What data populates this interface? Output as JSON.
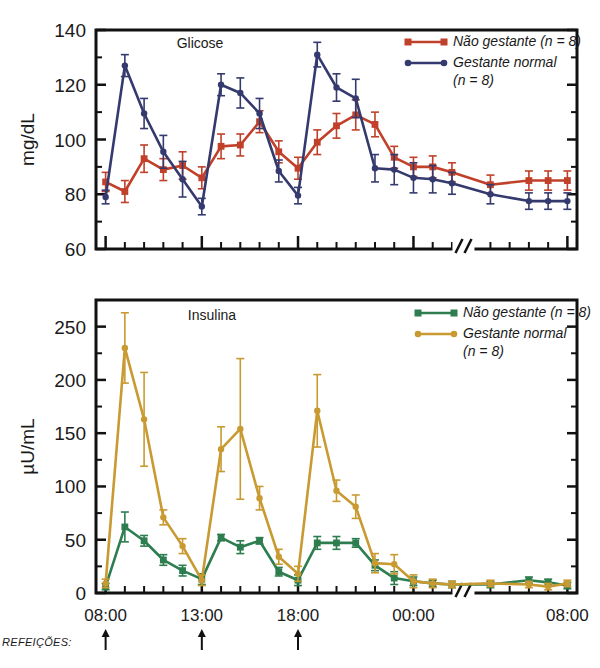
{
  "figure": {
    "background": "#ffffff",
    "meals_label": "REFEIÇÕES:",
    "axis_break_symbol": "//"
  },
  "chart_data": [
    {
      "type": "line",
      "title": "Glicose",
      "xlabel": "",
      "ylabel": "mg/dL",
      "ylim": [
        60,
        140
      ],
      "yticks": [
        60,
        80,
        100,
        120,
        140
      ],
      "yminor_step": 10,
      "grid": false,
      "legend_position": "top-right",
      "xlim_hours": [
        7.5,
        32.5
      ],
      "xtick_labels": [
        "08:00",
        "13:00",
        "18:00",
        "00:00",
        "08:00"
      ],
      "xtick_hours": [
        8,
        13,
        18,
        24,
        32
      ],
      "axis_break_hour": 26.6,
      "meal_arrow_hours": [
        8,
        13,
        18
      ],
      "series": [
        {
          "name": "Não gestante (n = 8)",
          "color": "#c0402a",
          "marker": "square",
          "x": [
            8,
            9,
            10,
            11,
            12,
            13,
            14,
            15,
            16,
            17,
            18,
            19,
            20,
            21,
            22,
            23,
            24,
            25,
            26,
            28,
            30,
            31,
            32
          ],
          "values": [
            84.5,
            81,
            93,
            89,
            90.5,
            86,
            97.5,
            98,
            106.5,
            95.5,
            89.5,
            99,
            105,
            109,
            105.5,
            93.5,
            90,
            90,
            88,
            83.5,
            85,
            85,
            85
          ],
          "err": [
            3.5,
            4,
            5,
            4,
            5,
            4,
            4.5,
            4,
            4,
            4,
            4,
            4.5,
            4.5,
            5.5,
            4.5,
            4,
            3.5,
            4,
            3.5,
            3.5,
            3.5,
            3.5,
            3.5
          ]
        },
        {
          "name": "Gestante normal (n = 8)",
          "color": "#353a6e",
          "marker": "circle",
          "x": [
            8,
            9,
            10,
            11,
            12,
            13,
            14,
            15,
            16,
            17,
            18,
            19,
            20,
            21,
            22,
            23,
            24,
            25,
            26,
            28,
            30,
            31,
            32
          ],
          "values": [
            79,
            127,
            109.5,
            95.5,
            85.5,
            75.5,
            120,
            117,
            109.5,
            88.5,
            79.5,
            131,
            119,
            115,
            89.5,
            89,
            86,
            85.5,
            84,
            80,
            77.5,
            77.5,
            77.5
          ],
          "err": [
            2.5,
            4,
            5.5,
            6,
            6.5,
            3,
            4,
            5.5,
            5.5,
            4,
            3,
            4.5,
            5,
            7,
            5,
            5.5,
            5.5,
            5,
            4,
            3.5,
            3,
            3,
            3
          ]
        }
      ]
    },
    {
      "type": "line",
      "title": "Insulina",
      "xlabel": "",
      "ylabel": "µU/mL",
      "ylim": [
        0,
        275
      ],
      "yticks": [
        0,
        50,
        100,
        150,
        200,
        250
      ],
      "yminor_step": 25,
      "grid": false,
      "legend_position": "top-right",
      "xlim_hours": [
        7.5,
        32.5
      ],
      "xtick_labels": [
        "08:00",
        "13:00",
        "18:00",
        "00:00",
        "08:00"
      ],
      "xtick_hours": [
        8,
        13,
        18,
        24,
        32
      ],
      "axis_break_hour": 26.6,
      "meal_arrow_hours": [
        8,
        13,
        18
      ],
      "series": [
        {
          "name": "Não gestante (n = 8)",
          "color": "#2e7d4f",
          "marker": "square",
          "x": [
            8,
            9,
            10,
            11,
            12,
            13,
            14,
            15,
            16,
            17,
            18,
            19,
            20,
            21,
            22,
            23,
            24,
            25,
            26,
            28,
            30,
            31,
            32
          ],
          "values": [
            6,
            62,
            49,
            31,
            21,
            13,
            52,
            43,
            49,
            20,
            12,
            47,
            47,
            47,
            26,
            14,
            11,
            9,
            8,
            8,
            12,
            10,
            7
          ],
          "err": [
            3,
            14,
            5,
            5,
            5,
            5,
            3,
            6,
            3,
            4,
            5,
            6,
            6,
            4,
            5,
            6,
            4,
            3,
            3,
            3,
            3,
            3,
            3
          ]
        },
        {
          "name": "Gestante normal (n = 8)",
          "color": "#c99a32",
          "marker": "circle",
          "x": [
            8,
            9,
            10,
            11,
            12,
            13,
            14,
            15,
            16,
            17,
            18,
            19,
            20,
            21,
            22,
            23,
            24,
            25,
            26,
            28,
            30,
            31,
            32
          ],
          "values": [
            9,
            230,
            163,
            71,
            44,
            12,
            135,
            154,
            89,
            34,
            18,
            171,
            96,
            81,
            28,
            27,
            11,
            9,
            8,
            9,
            8,
            6,
            9
          ],
          "err": [
            4,
            33,
            44,
            7,
            7,
            5,
            21,
            66,
            11,
            7,
            7,
            34,
            10,
            11,
            9,
            9,
            6,
            4,
            3,
            3,
            3,
            3,
            3
          ]
        }
      ]
    }
  ]
}
